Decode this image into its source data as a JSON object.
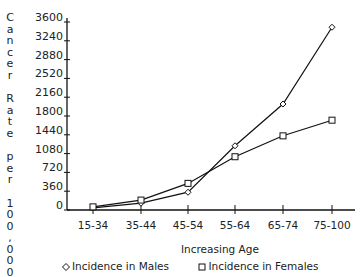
{
  "chart_data": {
    "type": "line",
    "title": "",
    "xlabel": "Increasing Age",
    "ylabel": "Cancer Rate per 100,000",
    "categories": [
      "15-34",
      "35-44",
      "45-54",
      "55-64",
      "65-74",
      "75-100"
    ],
    "series": [
      {
        "name": "Incidence in Males",
        "marker": "diamond",
        "values": [
          40,
          130,
          340,
          1230,
          2030,
          3500
        ]
      },
      {
        "name": "Incidence in Females",
        "marker": "square",
        "values": [
          60,
          190,
          510,
          1020,
          1420,
          1720
        ]
      }
    ],
    "yticks": [
      0,
      360,
      720,
      1080,
      1440,
      1800,
      2160,
      2520,
      2880,
      3240,
      3600
    ],
    "ylim": [
      0,
      3600
    ],
    "grid": false,
    "legend_position": "bottom"
  },
  "axis": {
    "ylabel_chars": [
      "C",
      "a",
      "n",
      "c",
      "e",
      "r",
      "",
      "R",
      "a",
      "t",
      "e",
      "",
      "p",
      "e",
      "r",
      "",
      "1",
      "0",
      "0",
      ",",
      "0",
      "0",
      "0"
    ],
    "xtitle": "Increasing Age"
  },
  "legend": {
    "males": "Incidence in Males",
    "females": "Incidence in Females"
  },
  "colors": {
    "line": "#111111",
    "text": "#222222",
    "background": "#ffffff"
  }
}
